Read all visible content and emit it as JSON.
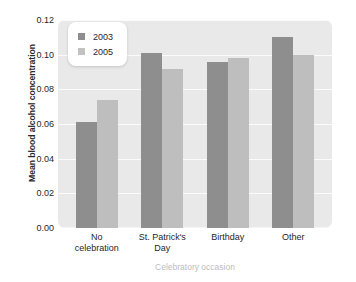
{
  "chart_data": {
    "type": "bar",
    "title": "",
    "subtitle": "",
    "xlabel": "Celebratory occasion",
    "ylabel": "Mean blood alcohol concentration",
    "categories": [
      "No celebration",
      "St. Patrick's Day",
      "Birthday",
      "Other"
    ],
    "category_lines": [
      [
        "No",
        "celebration"
      ],
      [
        "St. Patrick's",
        "Day"
      ],
      [
        "Birthday"
      ],
      [
        "Other"
      ]
    ],
    "series": [
      {
        "name": "2003",
        "color": "#8e8e8e",
        "values": [
          0.061,
          0.101,
          0.096,
          0.11
        ]
      },
      {
        "name": "2005",
        "color": "#bebebe",
        "values": [
          0.074,
          0.092,
          0.098,
          0.1
        ]
      }
    ],
    "ylim": [
      0.0,
      0.12
    ],
    "yticks": [
      0.12,
      0.1,
      0.08,
      0.06,
      0.04,
      0.02,
      0.0
    ],
    "ytick_labels": [
      "0.12",
      "0.10",
      "0.08",
      "0.06",
      "0.04",
      "0.02",
      "0.00"
    ],
    "grid": true,
    "grid_color": "#fbfbfb",
    "legend_position": "top-left",
    "plot_background": "#e9e9e9",
    "page_background": "#ffffff"
  },
  "legend": {
    "entries": [
      {
        "label": "2003"
      },
      {
        "label": "2005"
      }
    ]
  }
}
